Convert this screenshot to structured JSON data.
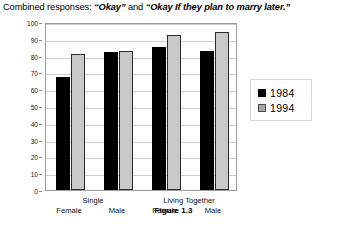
{
  "figure": {
    "title_prefix": "Combined responses:",
    "title_quote_1": "“Okay”",
    "title_conjunction": "and",
    "title_quote_2": "“Okay If they plan to marry later.”",
    "caption": "Figure 1.3"
  },
  "legend": {
    "position": "right",
    "entries": [
      {
        "label": "1984",
        "color": "#000000"
      },
      {
        "label": "1994",
        "color": "#c9c9c9"
      }
    ]
  },
  "chart_data": {
    "type": "bar",
    "title": "Combined responses: “Okay” and “Okay If they plan to marry later.”",
    "xlabel": "",
    "ylabel": "",
    "ylim": [
      0,
      100
    ],
    "yticks": [
      0,
      10,
      20,
      30,
      40,
      50,
      60,
      70,
      80,
      90,
      100
    ],
    "ytick_labels": [
      "0",
      "10",
      "20",
      "30",
      "40",
      "50",
      "60",
      "70",
      "80",
      "90",
      "100"
    ],
    "grid": true,
    "legend_position": "right",
    "groups": [
      {
        "label": "Single",
        "subcategories": [
          "Female",
          "Male"
        ]
      },
      {
        "label": "Living Together",
        "subcategories": [
          "Female",
          "Male"
        ]
      }
    ],
    "categories": [
      "Single Female",
      "Single Male",
      "Living Together Female",
      "Living Together Male"
    ],
    "series": [
      {
        "name": "1984",
        "color": "#000000",
        "values": [
          67,
          82,
          85,
          83
        ]
      },
      {
        "name": "1994",
        "color": "#c9c9c9",
        "values": [
          81,
          82.5,
          92.5,
          94
        ]
      }
    ]
  }
}
